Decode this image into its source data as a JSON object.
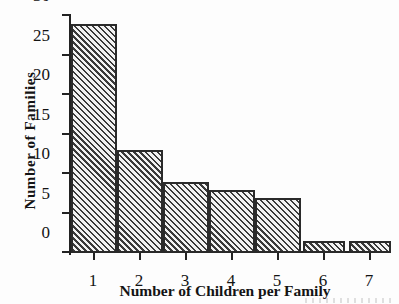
{
  "chart_data": {
    "type": "bar",
    "title": "",
    "subtitle": "",
    "xlabel": "Number of Children per Family",
    "ylabel": "Number  of  Families",
    "categories": [
      "1",
      "2",
      "3",
      "4",
      "5",
      "6",
      "7"
    ],
    "values": [
      29,
      13,
      9,
      8,
      7,
      1.5,
      1.5
    ],
    "series": [
      {
        "name": "Number of Families",
        "values": [
          29,
          13,
          9,
          8,
          7,
          1.5,
          1.5
        ]
      }
    ],
    "ylim": [
      0,
      30
    ],
    "xlim_categories": 7,
    "ytick_labels": [
      "0",
      "5",
      "10",
      "15",
      "20",
      "25",
      "30"
    ],
    "ytick_values": [
      0,
      5,
      10,
      15,
      20,
      25,
      30
    ],
    "ytick_step": 5,
    "xtick_labels": [
      "1",
      "2",
      "3",
      "4",
      "5",
      "6",
      "7"
    ],
    "grid": false,
    "legend": false,
    "legend_position": "none",
    "bar_fill": "diagonal-hatch",
    "bar_edge_color": "#2a2a2a",
    "bar_fill_color": "#e8e8e8",
    "bar_hatch_color": "#3a3a3a",
    "axis_color": "#222222",
    "background_color": "#fdfdfd",
    "text_color": "#141414",
    "annotations": []
  }
}
